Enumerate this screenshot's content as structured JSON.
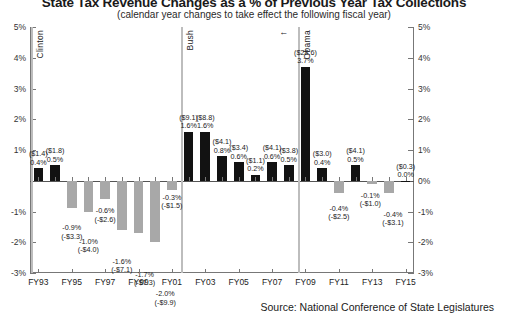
{
  "chart_data": {
    "type": "bar",
    "title": "State Tax Revenue Changes as a % of Previous Year Tax Collections",
    "subtitle": "(calendar year changes to take effect the following fiscal year)",
    "source": "Source: National Conference of State Legislatures",
    "xlabel": "",
    "ylabel": "",
    "ylim": [
      -3,
      5
    ],
    "yticks": [
      5,
      4,
      3,
      2,
      1,
      0,
      -1,
      -2,
      -3
    ],
    "ytick_labels_left": [
      "5%",
      "4%",
      "3%",
      "2%",
      "1%",
      "",
      "-1%",
      "-2%",
      "-3%"
    ],
    "ytick_labels_right": [
      "5%",
      "4%",
      "3%",
      "2%",
      "1%",
      "0%",
      "-1%",
      "-2%",
      "-3%"
    ],
    "grid": false,
    "legend": "none",
    "x_tick_labels": [
      "FY93",
      "FY95",
      "FY97",
      "FY99",
      "FY01",
      "FY03",
      "FY05",
      "FY07",
      "FY09",
      "FY11",
      "FY13",
      "FY15"
    ],
    "categories": [
      "FY93",
      "FY94",
      "FY95",
      "FY96",
      "FY97",
      "FY98",
      "FY99",
      "FY00",
      "FY01",
      "FY02",
      "FY03",
      "FY04",
      "FY05",
      "FY06",
      "FY07",
      "FY08",
      "FY09",
      "FY10",
      "FY11",
      "FY12",
      "FY13",
      "FY14",
      "FY15"
    ],
    "values": [
      0.4,
      0.5,
      -0.9,
      -1.0,
      -0.6,
      -1.6,
      -1.7,
      -2.0,
      -0.3,
      1.6,
      1.6,
      0.8,
      0.6,
      0.2,
      0.6,
      0.5,
      3.7,
      0.4,
      -0.4,
      0.5,
      -0.1,
      -0.4,
      0.0
    ],
    "dollar_values": [
      "($1.4)",
      "($1.8)",
      "(-$3.3)",
      "(-$4.0)",
      "(-$2.6)",
      "(-$7.1)",
      "(-$7.3)",
      "(-$9.9)",
      "(-$1.5)",
      "($9.1)",
      "($8.8)",
      "($4.1)",
      "($3.4)",
      "($1.1)",
      "($4.1)",
      "($3.8)",
      "($28.6)",
      "($3.0)",
      "(-$2.5)",
      "($4.1)",
      "(-$1.0)",
      "(-$3.1)",
      "($0.3)"
    ],
    "percent_labels": [
      "0.4%",
      "0.5%",
      "-0.9%",
      "-1.0%",
      "-0.6%",
      "-1.6%",
      "-1.7%",
      "-2.0%",
      "-0.3%",
      "1.6%",
      "1.6%",
      "0.8%",
      "0.6%",
      "0.2%",
      "0.6%",
      "0.5%",
      "3.7%",
      "0.4%",
      "-0.4%",
      "0.5%",
      "-0.1%",
      "-0.4%",
      "0.0%"
    ],
    "colors": {
      "positive": "#121212",
      "negative": "#a8a8a8",
      "divider": "#bdbdbd",
      "axis": "#777777"
    },
    "annotations": [
      {
        "label": "Clinton",
        "at": "FY93"
      },
      {
        "label": "Bush",
        "at": "FY01"
      },
      {
        "label": "Obama",
        "at": "FY09"
      }
    ]
  }
}
